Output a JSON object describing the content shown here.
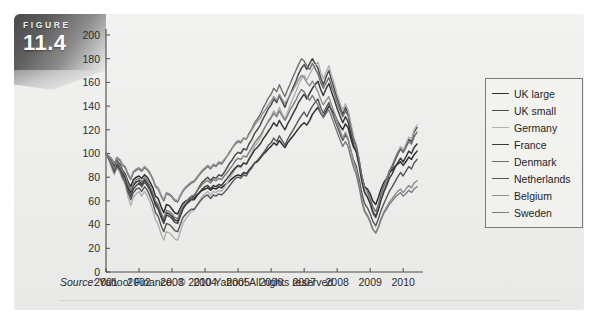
{
  "figure": {
    "word": "FIGURE",
    "number": "11.4"
  },
  "source": {
    "label": "Source",
    "text": ": Yahoo! Finance. © 2010 Yahoo! All rights reserved."
  },
  "legend": {
    "position": "right",
    "items": [
      {
        "label": "UK large",
        "color": "#2e2e2e"
      },
      {
        "label": "UK small",
        "color": "#4a4a4a"
      },
      {
        "label": "Germany",
        "color": "#b0b0b0"
      },
      {
        "label": "France",
        "color": "#3a3a3a"
      },
      {
        "label": "Denmark",
        "color": "#6e6e6e"
      },
      {
        "label": "Netherlands",
        "color": "#565656"
      },
      {
        "label": "Belgium",
        "color": "#909090"
      },
      {
        "label": "Sweden",
        "color": "#7c7c7c"
      }
    ]
  },
  "chart_data": {
    "type": "line",
    "title": "",
    "subtitle": "",
    "xlabel": "",
    "ylabel": "",
    "xlim": [
      2001,
      2010.6
    ],
    "ylim": [
      0,
      200
    ],
    "ytick_step": 20,
    "grid": false,
    "legend_position": "right",
    "note": "Index of European equity markets, 2001 = 100. Monthly observations.",
    "xticks": [
      "2001",
      "2002",
      "2003",
      "2004",
      "2005",
      "2006",
      "2007",
      "2008",
      "2009",
      "2010"
    ],
    "yticks": [
      "0",
      "20",
      "40",
      "60",
      "80",
      "100",
      "120",
      "140",
      "160",
      "180",
      "200"
    ],
    "x": [
      2001.0,
      2001.08,
      2001.17,
      2001.25,
      2001.33,
      2001.42,
      2001.5,
      2001.58,
      2001.67,
      2001.75,
      2001.83,
      2001.92,
      2002.0,
      2002.08,
      2002.17,
      2002.25,
      2002.33,
      2002.42,
      2002.5,
      2002.58,
      2002.67,
      2002.75,
      2002.83,
      2002.92,
      2003.0,
      2003.08,
      2003.17,
      2003.25,
      2003.33,
      2003.42,
      2003.5,
      2003.58,
      2003.67,
      2003.75,
      2003.83,
      2003.92,
      2004.0,
      2004.08,
      2004.17,
      2004.25,
      2004.33,
      2004.42,
      2004.5,
      2004.58,
      2004.67,
      2004.75,
      2004.83,
      2004.92,
      2005.0,
      2005.08,
      2005.17,
      2005.25,
      2005.33,
      2005.42,
      2005.5,
      2005.58,
      2005.67,
      2005.75,
      2005.83,
      2005.92,
      2006.0,
      2006.08,
      2006.17,
      2006.25,
      2006.33,
      2006.42,
      2006.5,
      2006.58,
      2006.67,
      2006.75,
      2006.83,
      2006.92,
      2007.0,
      2007.08,
      2007.17,
      2007.25,
      2007.33,
      2007.42,
      2007.5,
      2007.58,
      2007.67,
      2007.75,
      2007.83,
      2007.92,
      2008.0,
      2008.08,
      2008.17,
      2008.25,
      2008.33,
      2008.42,
      2008.5,
      2008.58,
      2008.67,
      2008.75,
      2008.83,
      2008.92,
      2009.0,
      2009.08,
      2009.17,
      2009.25,
      2009.33,
      2009.42,
      2009.5,
      2009.58,
      2009.67,
      2009.75,
      2009.83,
      2009.92,
      2010.0,
      2010.08,
      2010.17,
      2010.25,
      2010.33,
      2010.42
    ],
    "series": [
      {
        "name": "UK large",
        "color": "#2e2e2e",
        "width": 1.5,
        "values": [
          100,
          97,
          93,
          89,
          94,
          91,
          86,
          83,
          76,
          72,
          78,
          80,
          81,
          79,
          82,
          80,
          76,
          71,
          64,
          62,
          55,
          50,
          57,
          56,
          53,
          50,
          49,
          54,
          58,
          60,
          61,
          63,
          62,
          65,
          67,
          69,
          70,
          71,
          69,
          71,
          70,
          72,
          71,
          73,
          75,
          77,
          79,
          81,
          82,
          81,
          84,
          83,
          86,
          89,
          92,
          93,
          96,
          99,
          101,
          104,
          106,
          109,
          107,
          111,
          108,
          105,
          109,
          112,
          115,
          118,
          121,
          124,
          126,
          124,
          128,
          133,
          136,
          139,
          134,
          131,
          136,
          140,
          137,
          133,
          128,
          124,
          120,
          125,
          122,
          112,
          105,
          102,
          92,
          80,
          72,
          70,
          66,
          60,
          57,
          63,
          70,
          76,
          79,
          84,
          86,
          89,
          91,
          93,
          90,
          93,
          97,
          95,
          99,
          102
        ]
      },
      {
        "name": "UK small",
        "color": "#4a4a4a",
        "width": 1.5,
        "values": [
          100,
          96,
          90,
          85,
          90,
          87,
          82,
          79,
          70,
          64,
          70,
          73,
          75,
          72,
          76,
          73,
          69,
          63,
          56,
          53,
          46,
          41,
          48,
          47,
          45,
          42,
          41,
          47,
          53,
          57,
          60,
          63,
          64,
          68,
          72,
          76,
          78,
          80,
          77,
          80,
          79,
          82,
          81,
          84,
          88,
          92,
          95,
          99,
          101,
          100,
          104,
          103,
          108,
          112,
          117,
          120,
          124,
          129,
          133,
          138,
          141,
          146,
          143,
          149,
          144,
          139,
          145,
          150,
          156,
          161,
          167,
          172,
          175,
          171,
          176,
          180,
          176,
          172,
          164,
          158,
          165,
          170,
          162,
          154,
          147,
          140,
          133,
          139,
          134,
          122,
          112,
          106,
          93,
          78,
          68,
          64,
          58,
          50,
          46,
          53,
          62,
          70,
          76,
          83,
          88,
          94,
          99,
          104,
          101,
          106,
          112,
          110,
          118,
          122
        ]
      },
      {
        "name": "Germany",
        "color": "#b0b0b0",
        "width": 1.4,
        "values": [
          100,
          95,
          88,
          82,
          88,
          84,
          78,
          74,
          63,
          56,
          63,
          66,
          68,
          64,
          68,
          64,
          59,
          52,
          44,
          40,
          32,
          27,
          34,
          33,
          31,
          28,
          27,
          34,
          41,
          45,
          48,
          51,
          52,
          56,
          60,
          64,
          66,
          68,
          65,
          68,
          67,
          69,
          68,
          71,
          75,
          79,
          83,
          87,
          89,
          88,
          92,
          91,
          96,
          101,
          106,
          109,
          113,
          118,
          123,
          128,
          131,
          136,
          133,
          139,
          134,
          129,
          135,
          141,
          147,
          152,
          158,
          163,
          166,
          162,
          167,
          171,
          174,
          177,
          169,
          163,
          169,
          174,
          166,
          158,
          150,
          143,
          136,
          142,
          137,
          125,
          114,
          108,
          94,
          79,
          69,
          65,
          59,
          51,
          47,
          54,
          63,
          71,
          78,
          85,
          90,
          96,
          101,
          106,
          103,
          108,
          114,
          112,
          120,
          124
        ]
      },
      {
        "name": "France",
        "color": "#3a3a3a",
        "width": 1.5,
        "values": [
          100,
          96,
          91,
          86,
          92,
          89,
          84,
          80,
          72,
          67,
          73,
          76,
          77,
          74,
          78,
          75,
          71,
          65,
          58,
          55,
          48,
          43,
          50,
          49,
          47,
          44,
          43,
          49,
          54,
          57,
          59,
          61,
          61,
          64,
          67,
          70,
          72,
          73,
          70,
          73,
          72,
          74,
          73,
          76,
          79,
          82,
          85,
          88,
          90,
          89,
          92,
          91,
          95,
          99,
          103,
          105,
          108,
          112,
          115,
          119,
          122,
          126,
          123,
          128,
          124,
          120,
          125,
          129,
          134,
          138,
          143,
          147,
          150,
          146,
          151,
          155,
          158,
          161,
          154,
          149,
          155,
          159,
          152,
          145,
          138,
          132,
          126,
          131,
          127,
          116,
          107,
          101,
          89,
          76,
          67,
          63,
          58,
          51,
          47,
          53,
          61,
          68,
          73,
          79,
          83,
          88,
          92,
          96,
          93,
          97,
          102,
          100,
          105,
          108
        ]
      },
      {
        "name": "Denmark",
        "color": "#6e6e6e",
        "width": 1.4,
        "values": [
          100,
          98,
          95,
          91,
          96,
          94,
          90,
          88,
          82,
          78,
          84,
          86,
          87,
          85,
          88,
          86,
          83,
          78,
          72,
          70,
          64,
          60,
          66,
          65,
          63,
          60,
          59,
          64,
          68,
          71,
          73,
          75,
          76,
          79,
          82,
          85,
          87,
          89,
          87,
          90,
          89,
          92,
          91,
          94,
          98,
          101,
          105,
          108,
          110,
          109,
          113,
          112,
          117,
          121,
          126,
          129,
          133,
          138,
          142,
          147,
          150,
          155,
          152,
          158,
          153,
          148,
          154,
          159,
          165,
          170,
          175,
          180,
          178,
          174,
          171,
          176,
          172,
          167,
          160,
          155,
          160,
          164,
          157,
          150,
          143,
          137,
          131,
          136,
          132,
          121,
          112,
          106,
          94,
          81,
          72,
          68,
          62,
          55,
          51,
          57,
          66,
          73,
          79,
          85,
          90,
          95,
          100,
          104,
          101,
          105,
          110,
          108,
          114,
          118
        ]
      },
      {
        "name": "Netherlands",
        "color": "#565656",
        "width": 1.4,
        "values": [
          100,
          96,
          90,
          84,
          89,
          86,
          80,
          76,
          67,
          61,
          67,
          70,
          71,
          68,
          72,
          69,
          64,
          58,
          50,
          47,
          39,
          34,
          41,
          40,
          38,
          35,
          34,
          40,
          46,
          49,
          51,
          53,
          53,
          56,
          59,
          62,
          64,
          65,
          62,
          65,
          64,
          66,
          65,
          67,
          70,
          73,
          76,
          79,
          80,
          79,
          82,
          81,
          85,
          88,
          92,
          94,
          97,
          100,
          103,
          107,
          109,
          113,
          110,
          115,
          111,
          107,
          112,
          116,
          120,
          124,
          128,
          132,
          135,
          131,
          136,
          140,
          143,
          146,
          139,
          134,
          139,
          143,
          136,
          129,
          123,
          117,
          111,
          116,
          112,
          102,
          94,
          89,
          78,
          66,
          58,
          54,
          49,
          43,
          39,
          45,
          52,
          58,
          63,
          68,
          72,
          76,
          80,
          84,
          81,
          85,
          89,
          87,
          92,
          95
        ]
      },
      {
        "name": "Belgium",
        "color": "#909090",
        "width": 1.4,
        "values": [
          100,
          98,
          96,
          92,
          97,
          95,
          91,
          89,
          83,
          79,
          85,
          87,
          88,
          86,
          89,
          87,
          84,
          79,
          73,
          71,
          65,
          61,
          67,
          66,
          64,
          61,
          60,
          65,
          69,
          72,
          74,
          76,
          77,
          80,
          83,
          86,
          88,
          90,
          88,
          91,
          90,
          93,
          92,
          95,
          98,
          102,
          105,
          109,
          111,
          110,
          113,
          112,
          116,
          120,
          124,
          127,
          130,
          134,
          137,
          141,
          144,
          148,
          145,
          150,
          146,
          142,
          146,
          150,
          154,
          158,
          162,
          166,
          164,
          160,
          157,
          161,
          157,
          152,
          146,
          141,
          145,
          148,
          141,
          134,
          127,
          120,
          113,
          118,
          113,
          102,
          92,
          86,
          74,
          61,
          52,
          48,
          43,
          36,
          33,
          38,
          45,
          51,
          55,
          59,
          62,
          65,
          68,
          70,
          67,
          70,
          73,
          71,
          75,
          77
        ]
      },
      {
        "name": "Sweden",
        "color": "#7c7c7c",
        "width": 1.4,
        "values": [
          100,
          97,
          92,
          87,
          93,
          90,
          85,
          82,
          74,
          69,
          75,
          78,
          79,
          76,
          80,
          77,
          73,
          67,
          60,
          57,
          50,
          45,
          52,
          51,
          49,
          46,
          45,
          51,
          56,
          59,
          62,
          64,
          65,
          68,
          71,
          74,
          76,
          77,
          75,
          78,
          77,
          79,
          78,
          81,
          84,
          87,
          90,
          94,
          96,
          95,
          98,
          97,
          101,
          105,
          109,
          112,
          115,
          119,
          123,
          127,
          130,
          134,
          131,
          136,
          132,
          128,
          132,
          137,
          141,
          145,
          150,
          154,
          152,
          148,
          145,
          149,
          145,
          141,
          135,
          130,
          134,
          137,
          131,
          124,
          118,
          112,
          106,
          110,
          106,
          96,
          88,
          82,
          71,
          59,
          51,
          47,
          42,
          36,
          33,
          38,
          44,
          50,
          53,
          57,
          60,
          63,
          65,
          67,
          64,
          66,
          69,
          67,
          70,
          72
        ]
      }
    ]
  }
}
